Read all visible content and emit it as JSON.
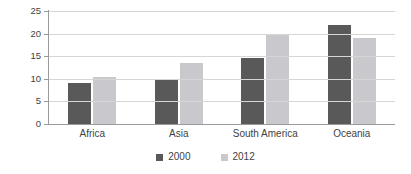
{
  "chart_data": {
    "type": "bar",
    "title": "",
    "subtitle": "",
    "xlabel": "",
    "ylabel": "",
    "categories": [
      "Africa",
      "Asia",
      "South America",
      "Oceania"
    ],
    "series": [
      {
        "name": "2000",
        "color": "#595959",
        "values": [
          9.0,
          9.9,
          14.5,
          21.8
        ]
      },
      {
        "name": "2012",
        "color": "#c9c9cd",
        "values": [
          10.3,
          13.4,
          20.0,
          19.0
        ]
      }
    ],
    "ylim": [
      0,
      25
    ],
    "ytick_step": 5,
    "yticks": [
      0,
      5,
      10,
      15,
      20,
      25
    ],
    "ytick_labels": [
      "0",
      "5",
      "10",
      "15",
      "20",
      "25"
    ],
    "grid": true,
    "grid_axis": "y",
    "legend_position": "bottom-center",
    "background_color": "#ffffff",
    "grid_color": "#d6d6d6",
    "axis_color": "#9a9a9a",
    "text_color": "#3f3f3f"
  }
}
